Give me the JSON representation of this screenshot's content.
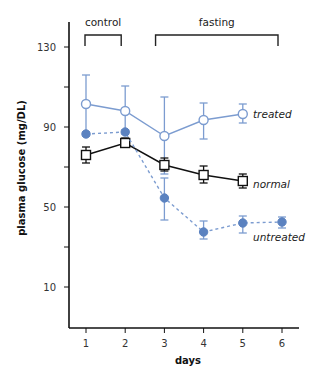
{
  "chart_data": {
    "type": "line",
    "title": "",
    "xlabel": "days",
    "ylabel": "plasma glucose (mg/DL)",
    "x": [
      1,
      2,
      3,
      4,
      5,
      6
    ],
    "x_ticks": [
      "1",
      "2",
      "3",
      "4",
      "5",
      "6"
    ],
    "y_ticks": [
      130,
      110,
      90,
      70,
      50,
      30,
      10
    ],
    "y_tick_labels": [
      "130",
      "90",
      "50",
      "10"
    ],
    "ylim": [
      -10,
      130
    ],
    "xlim": [
      0.6,
      6.4
    ],
    "grid": false,
    "legend_position": "inline-right",
    "groups": [
      {
        "label": "control",
        "from_day": 1,
        "to_day": 2
      },
      {
        "label": "fasting",
        "from_day": 2.8,
        "to_day": 6
      }
    ],
    "series": [
      {
        "name": "treated",
        "marker": "open-circle",
        "line": "solid",
        "color": "#7c9cd0",
        "x": [
          1,
          2,
          3,
          4,
          5
        ],
        "values": [
          101.5,
          98,
          85.5,
          93.5,
          96.5
        ],
        "err_upper": [
          116,
          110.5,
          105,
          102,
          101.5
        ],
        "err_lower": [
          86.5,
          87.5,
          66.5,
          84,
          92
        ]
      },
      {
        "name": "normal",
        "marker": "open-square",
        "line": "solid",
        "color": "#111111",
        "x": [
          1,
          2,
          3,
          4,
          5
        ],
        "values": [
          76,
          82,
          71,
          66,
          63
        ],
        "err_upper": [
          80,
          84.5,
          74.5,
          70.5,
          66.5
        ],
        "err_lower": [
          72,
          80.5,
          68,
          62,
          59.5
        ]
      },
      {
        "name": "untreated",
        "marker": "filled-circle",
        "line": "dashed",
        "color": "#5b82c0",
        "x": [
          1,
          2,
          3,
          4,
          5,
          6
        ],
        "values": [
          86.5,
          87.5,
          54.5,
          37.5,
          42,
          42.5
        ],
        "err_upper": [
          87.5,
          88.5,
          64.5,
          43,
          45.5,
          45
        ],
        "err_lower": [
          85.5,
          86.5,
          43.5,
          34,
          37,
          39.5
        ]
      }
    ]
  }
}
